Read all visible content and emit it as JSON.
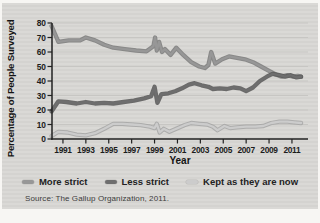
{
  "figure": {
    "background_color": "#d8d7d4",
    "axis_color": "#222222"
  },
  "chart_data": {
    "type": "line",
    "title": "",
    "xlabel": "Year",
    "ylabel": "Percentage of People Surveyed",
    "source": "Source: The Gallup Organization, 2011.",
    "xlim": [
      1990,
      2012
    ],
    "ylim": [
      0,
      80
    ],
    "y_ticks": [
      0,
      10,
      20,
      30,
      40,
      50,
      60,
      70,
      80
    ],
    "x_ticks": [
      1991,
      1993,
      1995,
      1997,
      1999,
      2001,
      2003,
      2005,
      2007,
      2009,
      2011
    ],
    "grid": "horizontal",
    "legend_position": "bottom",
    "series": [
      {
        "name": "More strict",
        "color": "#979797",
        "edge": "#7a7a7a",
        "points": [
          [
            1990,
            78
          ],
          [
            1990.6,
            67
          ],
          [
            1991.5,
            68
          ],
          [
            1992.5,
            68
          ],
          [
            1993,
            70
          ],
          [
            1993.8,
            68
          ],
          [
            1994.6,
            65
          ],
          [
            1995.4,
            63
          ],
          [
            1996.4,
            62
          ],
          [
            1997.4,
            61
          ],
          [
            1998.3,
            60.5
          ],
          [
            1998.9,
            64
          ],
          [
            1999.05,
            70
          ],
          [
            1999.2,
            61
          ],
          [
            1999.4,
            67
          ],
          [
            1999.65,
            60
          ],
          [
            1999.9,
            62
          ],
          [
            2000.4,
            58
          ],
          [
            2000.9,
            63
          ],
          [
            2001.5,
            58
          ],
          [
            2002.2,
            53
          ],
          [
            2002.9,
            50
          ],
          [
            2003.4,
            49
          ],
          [
            2003.7,
            51
          ],
          [
            2003.95,
            60
          ],
          [
            2004.3,
            52
          ],
          [
            2004.9,
            55
          ],
          [
            2005.5,
            57
          ],
          [
            2006.2,
            56
          ],
          [
            2006.9,
            55
          ],
          [
            2007.6,
            53
          ],
          [
            2008.3,
            50
          ],
          [
            2009,
            47
          ],
          [
            2009.6,
            44.5
          ],
          [
            2010.1,
            43
          ],
          [
            2010.6,
            44
          ],
          [
            2011.1,
            43
          ],
          [
            2011.5,
            43.5
          ],
          [
            2011.8,
            43
          ]
        ]
      },
      {
        "name": "Less strict",
        "color": "#6e6e6e",
        "edge": "#575757",
        "points": [
          [
            1990,
            19
          ],
          [
            1990.6,
            26
          ],
          [
            1991.3,
            25.5
          ],
          [
            1992.2,
            24.5
          ],
          [
            1993,
            25.5
          ],
          [
            1993.8,
            24.5
          ],
          [
            1994.6,
            25
          ],
          [
            1995.4,
            24.5
          ],
          [
            1996.3,
            25.5
          ],
          [
            1997.2,
            26.5
          ],
          [
            1998.1,
            28
          ],
          [
            1998.7,
            29.5
          ],
          [
            1999,
            36
          ],
          [
            1999.25,
            25
          ],
          [
            1999.6,
            31
          ],
          [
            2000.2,
            31.5
          ],
          [
            2000.8,
            33
          ],
          [
            2001.4,
            35
          ],
          [
            2002,
            37.5
          ],
          [
            2002.5,
            38.5
          ],
          [
            2003.1,
            37
          ],
          [
            2003.7,
            36
          ],
          [
            2004.1,
            34.5
          ],
          [
            2004.7,
            35
          ],
          [
            2005.3,
            34.5
          ],
          [
            2005.9,
            35.5
          ],
          [
            2006.5,
            35
          ],
          [
            2007,
            33
          ],
          [
            2007.6,
            35.5
          ],
          [
            2008.2,
            40
          ],
          [
            2008.8,
            43
          ],
          [
            2009.3,
            45
          ],
          [
            2009.9,
            44
          ],
          [
            2010.4,
            43
          ],
          [
            2010.9,
            44
          ],
          [
            2011.4,
            42.5
          ],
          [
            2011.8,
            43
          ]
        ]
      },
      {
        "name": "Kept as they are now",
        "color": "#cccccc",
        "edge": "#a5a5a5",
        "points": [
          [
            1990,
            2
          ],
          [
            1990.6,
            5
          ],
          [
            1991.4,
            4.5
          ],
          [
            1992.2,
            3
          ],
          [
            1993,
            2.5
          ],
          [
            1993.8,
            4
          ],
          [
            1994.6,
            7
          ],
          [
            1995.4,
            10.5
          ],
          [
            1996.2,
            10.5
          ],
          [
            1997,
            10
          ],
          [
            1997.8,
            9.5
          ],
          [
            1998.6,
            8.5
          ],
          [
            1999,
            7.5
          ],
          [
            1999.2,
            10.5
          ],
          [
            1999.45,
            4.5
          ],
          [
            1999.8,
            7
          ],
          [
            2000.3,
            5
          ],
          [
            2000.9,
            7
          ],
          [
            2001.6,
            9.5
          ],
          [
            2002.2,
            11
          ],
          [
            2002.9,
            10.5
          ],
          [
            2003.6,
            10
          ],
          [
            2004.1,
            8.5
          ],
          [
            2004.5,
            6
          ],
          [
            2005.1,
            9
          ],
          [
            2005.6,
            7.5
          ],
          [
            2006.2,
            8
          ],
          [
            2007,
            8.5
          ],
          [
            2007.8,
            8.5
          ],
          [
            2008.5,
            9
          ],
          [
            2009.2,
            11
          ],
          [
            2009.9,
            12
          ],
          [
            2010.6,
            12
          ],
          [
            2011.2,
            11.5
          ],
          [
            2011.8,
            11
          ]
        ]
      }
    ]
  }
}
